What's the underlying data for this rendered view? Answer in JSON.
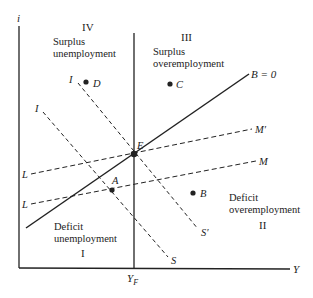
{
  "axes": {
    "y_label": "i",
    "x_label": "Y",
    "full_employment_label": "Y",
    "full_employment_subscript": "F"
  },
  "quadrants": {
    "I": {
      "numeral": "I",
      "line1": "Deficit",
      "line2": "unemployment"
    },
    "II": {
      "numeral": "II",
      "line1": "Deficit",
      "line2": "overemployment"
    },
    "III": {
      "numeral": "III",
      "line1": "Surplus",
      "line2": "overemployment"
    },
    "IV": {
      "numeral": "IV",
      "line1": "Surplus",
      "line2": "unemployment"
    }
  },
  "curves": {
    "balance": {
      "label": "B = 0",
      "style": "solid"
    },
    "is_upper": {
      "start_label": "I",
      "end_label": "S′",
      "style": "dashed"
    },
    "is_lower": {
      "start_label": "I",
      "end_label": "S",
      "style": "dashed"
    },
    "lm_upper": {
      "start_label": "L",
      "end_label": "M′",
      "style": "dashed"
    },
    "lm_lower": {
      "start_label": "L",
      "end_label": "M",
      "style": "dashed"
    }
  },
  "points": {
    "E": "E",
    "A": "A",
    "B": "B",
    "C": "C",
    "D": "D"
  },
  "colors": {
    "ink": "#222222",
    "background": "#ffffff"
  }
}
